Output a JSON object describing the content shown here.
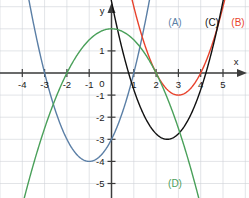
{
  "figure": {
    "background_color": "#ffffff",
    "grid_color": "#cfd2d6",
    "axis_color": "#3c3c3c",
    "text_color": "#1a1a1a"
  },
  "axes": {
    "x_name": "x",
    "y_name": "y",
    "origin_label": "0",
    "x_tick_labels": [
      "-4",
      "-3",
      "-2",
      "-1",
      "1",
      "2",
      "3",
      "4",
      "5"
    ],
    "x_tick_values": [
      -4,
      -3,
      -2,
      -1,
      1,
      2,
      3,
      4,
      5
    ],
    "y_tick_labels": [
      "1",
      "-1",
      "-2",
      "-3",
      "-4",
      "-5"
    ],
    "y_tick_values": [
      1,
      -1,
      -2,
      -3,
      -4,
      -5
    ]
  },
  "legend": {
    "items": [
      {
        "label": "(A)",
        "color": "#5b7fa6"
      },
      {
        "label": "(B)",
        "color": "#e8422c"
      },
      {
        "label": "(C)",
        "color": "#111111"
      },
      {
        "label": "(D)",
        "color": "#4aa05a"
      }
    ]
  },
  "chart_data": {
    "type": "line",
    "xlabel": "x",
    "ylabel": "y",
    "xlim": [
      -4.9,
      5.9
    ],
    "ylim": [
      -5.6,
      3.3
    ],
    "grid": true,
    "grid_spacing": 1,
    "legend": "inline-labels",
    "series": [
      {
        "name": "(A)",
        "color": "#5b7fa6",
        "equation": "y = (x + 1)^2 - 4",
        "vertex": [
          -1,
          -4
        ],
        "roots": [
          -3,
          1
        ],
        "y_intercept": -3,
        "opens": "up",
        "x": [
          -3.3,
          -3.0,
          -2.5,
          -2.0,
          -1.5,
          -1.0,
          -0.5,
          0.0,
          0.5,
          1.0,
          1.5,
          1.8
        ],
        "y": [
          1.29,
          0.0,
          -1.75,
          -3.0,
          -3.75,
          -4.0,
          -3.75,
          -3.0,
          -1.75,
          0.0,
          2.25,
          3.84
        ]
      },
      {
        "name": "(B)",
        "color": "#e8422c",
        "equation": "y = (x - 3)^2 - 1",
        "vertex": [
          3,
          -1
        ],
        "roots": [
          2,
          4
        ],
        "y_intercept": 8,
        "opens": "up",
        "x": [
          1.8,
          2.0,
          2.5,
          3.0,
          3.5,
          4.0,
          4.5,
          5.0,
          5.1
        ],
        "y": [
          0.44,
          0.0,
          -0.75,
          -1.0,
          -0.75,
          0.0,
          1.25,
          3.0,
          3.41
        ]
      },
      {
        "name": "(C)",
        "color": "#111111",
        "equation": "y = (x - 2.5)^2 - 3",
        "vertex": [
          2.5,
          -3
        ],
        "roots": [
          0.77,
          4.23
        ],
        "y_intercept": 3.25,
        "opens": "up",
        "x": [
          0.75,
          1.0,
          1.5,
          2.0,
          2.5,
          3.0,
          3.5,
          4.0,
          4.5,
          4.7
        ],
        "y": [
          0.06,
          -0.75,
          -2.0,
          -2.75,
          -3.0,
          -2.75,
          -2.0,
          -0.75,
          1.0,
          1.84
        ]
      },
      {
        "name": "(D)",
        "color": "#4aa05a",
        "equation": "y = 2 - x^2 / 2",
        "vertex": [
          0,
          2
        ],
        "roots": [
          -2,
          2
        ],
        "y_intercept": 2,
        "opens": "down",
        "x": [
          -3.5,
          -3.0,
          -2.5,
          -2.0,
          -1.0,
          0.0,
          1.0,
          2.0,
          2.5,
          3.0,
          3.5
        ],
        "y": [
          -4.13,
          -2.5,
          -1.13,
          0.0,
          1.5,
          2.0,
          1.5,
          0.0,
          -1.13,
          -2.5,
          -4.13
        ]
      }
    ]
  }
}
